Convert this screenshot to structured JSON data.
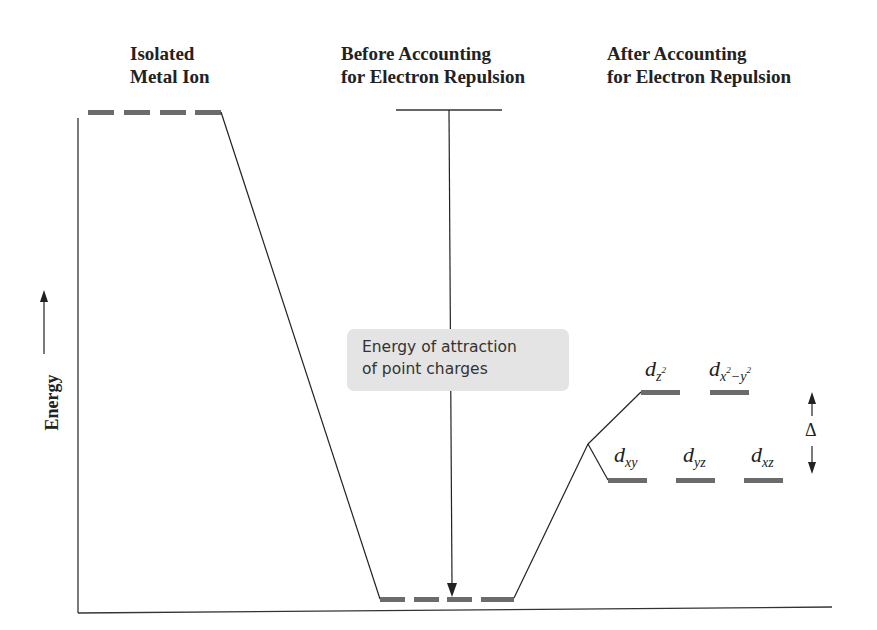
{
  "headers": {
    "isolated": [
      "Isolated",
      "Metal Ion"
    ],
    "before": [
      "Before Accounting",
      "for Electron Repulsion"
    ],
    "after": [
      "After Accounting",
      "for Electron Repulsion"
    ]
  },
  "axis": {
    "ylabel": "Energy"
  },
  "callout": {
    "lines": [
      "Energy of attraction",
      "of point charges"
    ]
  },
  "orbitals": {
    "upper": [
      {
        "base": "d",
        "sub": "z",
        "sup": "2"
      },
      {
        "base": "d",
        "sub": "x",
        "sup": "2",
        "sub2": "−y",
        "sup2": "2"
      }
    ],
    "lower": [
      {
        "base": "d",
        "sub": "xy"
      },
      {
        "base": "d",
        "sub": "yz"
      },
      {
        "base": "d",
        "sub": "xz"
      }
    ]
  },
  "splitting_label": "Δ",
  "colors": {
    "level": "#6b6b6b",
    "line": "#222222",
    "box": "#e4e4e4"
  }
}
